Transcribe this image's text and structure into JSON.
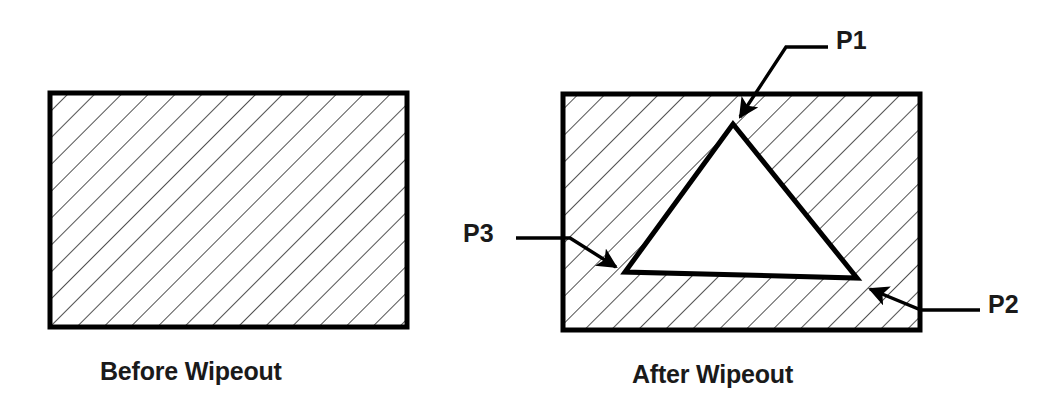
{
  "figure": {
    "background_color": "#ffffff",
    "line_color": "#000000",
    "text_color": "#1a1a1a",
    "hatch_color": "#333333",
    "wipeout_fill": "#ffffff"
  },
  "panels": [
    {
      "id": "before",
      "caption": "Before Wipeout",
      "rect": {
        "x": 50,
        "y": 93,
        "width": 357,
        "height": 234
      },
      "hatched": true,
      "wipeout": false
    },
    {
      "id": "after",
      "caption": "After Wipeout",
      "rect": {
        "x": 563,
        "y": 94,
        "width": 357,
        "height": 236
      },
      "hatched": true,
      "wipeout": true
    }
  ],
  "hatching": {
    "angle_degrees": 45,
    "spacing_px": 19,
    "stroke_width": 1.6,
    "direction": "down-right"
  },
  "wipeout_shape": {
    "type": "triangle",
    "stroke_width": 5,
    "fill": "#ffffff",
    "vertices": [
      {
        "name": "P1",
        "x": 733,
        "y": 124
      },
      {
        "name": "P2",
        "x": 857,
        "y": 278
      },
      {
        "name": "P3",
        "x": 625,
        "y": 272
      }
    ]
  },
  "labels": [
    {
      "id": "p1",
      "text": "P1"
    },
    {
      "id": "p2",
      "text": "P2"
    },
    {
      "id": "p3",
      "text": "P3"
    }
  ],
  "leaders": [
    {
      "id": "p1",
      "target": "P1",
      "path": "M 828 47 L 786 47 L 739 118",
      "arrow_tip": {
        "x": 735,
        "y": 124
      },
      "arrow_angle_degrees": 123
    },
    {
      "id": "p3",
      "target": "P3",
      "path": "M 516 238 L 570 238 L 618 268",
      "arrow_tip": {
        "x": 625,
        "y": 272
      },
      "arrow_angle_degrees": 32
    },
    {
      "id": "p2",
      "target": "P2",
      "path": "M 980 310 L 921 310 L 869 288",
      "arrow_tip": {
        "x": 861,
        "y": 285
      },
      "arrow_angle_degrees": 203
    }
  ]
}
